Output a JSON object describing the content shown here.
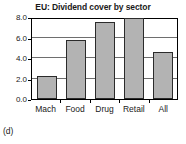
{
  "caption": "(d)",
  "colors": {
    "bar_fill": "#b3b3b3",
    "bar_stroke": "#2b2b2b",
    "axis": "#000000",
    "gridline": "#6e6e6e",
    "background": "#ffffff",
    "text": "#1a1a1a"
  },
  "chart_data": {
    "type": "bar",
    "title": "EU: Dividend cover by sector",
    "xlabel": "",
    "ylabel": "",
    "categories": [
      "Mach",
      "Food",
      "Drug",
      "Retail",
      "All"
    ],
    "values": [
      2.2,
      5.8,
      7.5,
      7.9,
      4.6
    ],
    "ylim": [
      0.0,
      8.0
    ],
    "yticks": [
      0.0,
      2.0,
      4.0,
      6.0,
      8.0
    ],
    "ytick_labels": [
      "0.0",
      "2.0",
      "4.0",
      "6.0",
      "8.0"
    ],
    "grid": true,
    "legend": null,
    "legend_position": "none"
  }
}
